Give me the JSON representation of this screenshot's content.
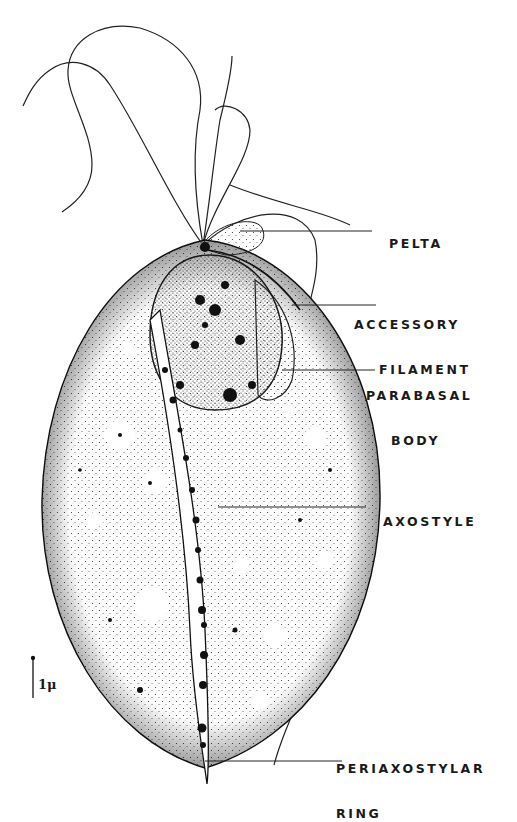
{
  "figure": {
    "ink_color": "#1a1a1a",
    "background": "#ffffff"
  },
  "labels": {
    "pelta": {
      "line1": "PELTA"
    },
    "accessory_filament": {
      "line1": "ACCESSORY",
      "line2": "FILAMENT"
    },
    "parabasal_body": {
      "line1": "PARABASAL",
      "line2": "BODY"
    },
    "axostyle": {
      "line1": "AXOSTYLE"
    },
    "periaxostylar_ring": {
      "line1": "PERIAXOSTYLAR",
      "line2": "RING"
    }
  },
  "scale_bar": {
    "label": "1μ"
  }
}
